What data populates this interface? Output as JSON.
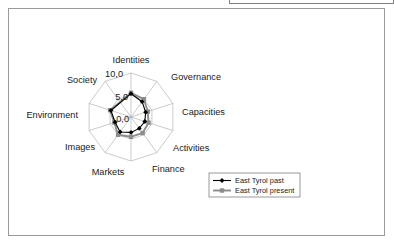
{
  "page": {
    "background_color": "#ffffff",
    "frame_border_color": "#9a9a9a"
  },
  "chart_data": {
    "type": "radar",
    "title": "",
    "subtitle": "",
    "xlabel": "",
    "ylabel": "",
    "categories": [
      "Identities",
      "Governance",
      "Capacities",
      "Activities",
      "Finance",
      "Markets",
      "Images",
      "Environment",
      "Society"
    ],
    "axis_count": 10,
    "radial_ticks": [
      "0,0",
      "5,0",
      "10,0"
    ],
    "radial_tick_values": [
      0.0,
      5.0,
      10.0
    ],
    "rlim": [
      0,
      10
    ],
    "grid": true,
    "legend_position": "bottom-right",
    "series": [
      {
        "name": "East Tyrol past",
        "color": "#000000",
        "marker": "diamond",
        "values": [
          5.3,
          4.3,
          3.5,
          3.3,
          3.2,
          3.5,
          4.2,
          3.8,
          4.8
        ]
      },
      {
        "name": "East Tyrol present",
        "color": "#8c8c8c",
        "marker": "square",
        "values": [
          5.5,
          5.0,
          4.0,
          4.2,
          4.5,
          4.5,
          5.0,
          4.0,
          5.0
        ]
      }
    ]
  },
  "labels": {
    "identities": "Identities",
    "governance": "Governance",
    "capacities": "Capacities",
    "activities": "Activities",
    "finance": "Finance",
    "markets": "Markets",
    "images": "Images",
    "environment": "Environment",
    "society": "Society",
    "tick_0": "0,0",
    "tick_5": "5,0",
    "tick_10": "10,0"
  },
  "legend": {
    "entries": [
      {
        "label": "East Tyrol past"
      },
      {
        "label": "East Tyrol present"
      }
    ]
  }
}
